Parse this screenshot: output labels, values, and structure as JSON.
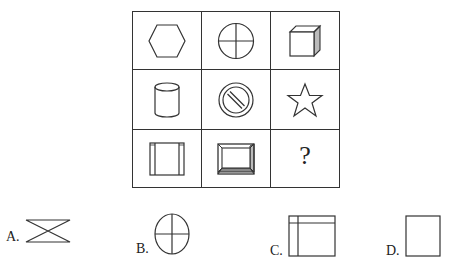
{
  "puzzle": {
    "type": "3x3 figure reasoning matrix",
    "cells": [
      {
        "row": 1,
        "col": 1,
        "shape": "hexagon"
      },
      {
        "row": 1,
        "col": 2,
        "shape": "circle-with-cross"
      },
      {
        "row": 1,
        "col": 3,
        "shape": "cube"
      },
      {
        "row": 2,
        "col": 1,
        "shape": "cylinder"
      },
      {
        "row": 2,
        "col": 2,
        "shape": "prohibition-sign"
      },
      {
        "row": 2,
        "col": 3,
        "shape": "star"
      },
      {
        "row": 3,
        "col": 1,
        "shape": "square-with-vertical-side-bars"
      },
      {
        "row": 3,
        "col": 2,
        "shape": "beveled-square-frame"
      },
      {
        "row": 3,
        "col": 3,
        "shape": "unknown",
        "text": "?"
      }
    ],
    "question_mark": "?"
  },
  "options": [
    {
      "label": "A.",
      "shape": "hourglass-bowtie"
    },
    {
      "label": "B.",
      "shape": "ellipse-with-cross"
    },
    {
      "label": "C.",
      "shape": "rectangle-with-top-and-left-lines"
    },
    {
      "label": "D.",
      "shape": "rectangle"
    }
  ],
  "colors": {
    "stroke": "#333333",
    "shade": "#bbbbbb",
    "background": "#ffffff"
  }
}
